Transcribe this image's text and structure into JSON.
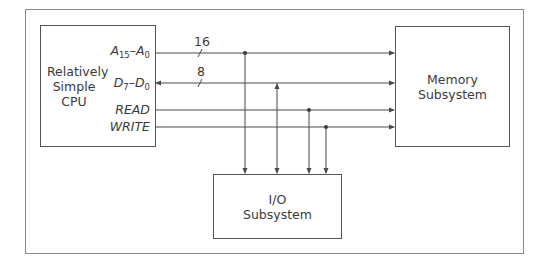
{
  "diagram": {
    "blocks": {
      "cpu": {
        "label": "Relatively\nSimple\nCPU"
      },
      "memory": {
        "label": "Memory\nSubsystem"
      },
      "io": {
        "label": "I/O\nSubsystem"
      }
    },
    "signals": {
      "address": {
        "name": "A",
        "hi": "15",
        "sep": "–",
        "lo": "0",
        "width": "16"
      },
      "data": {
        "name": "D",
        "hi": "7",
        "sep": "–",
        "lo": "0",
        "width": "8"
      },
      "read": {
        "label": "READ"
      },
      "write": {
        "label": "WRITE"
      }
    },
    "colors": {
      "line": "#4a4a4a",
      "frame": "#8a8a8a",
      "text": "#3a3a3a"
    }
  }
}
